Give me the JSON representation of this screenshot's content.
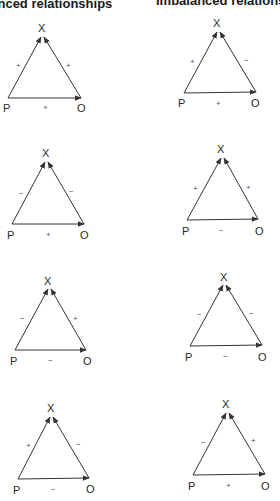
{
  "headers": {
    "left": "Balanced relationships",
    "right": "Imbalanced relationships"
  },
  "colors": {
    "line": "#333333",
    "text": "#1a1a1a"
  },
  "triangles": [
    {
      "group": "balanced",
      "vertex_labels": {
        "top": "X",
        "left": "P",
        "right": "O"
      },
      "signs": {
        "P_X": "+",
        "O_X": "+",
        "P_O": "+"
      }
    },
    {
      "group": "imbalanced",
      "vertex_labels": {
        "top": "X",
        "left": "P",
        "right": "O"
      },
      "signs": {
        "P_X": "+",
        "O_X": "−",
        "P_O": "+"
      }
    },
    {
      "group": "balanced",
      "vertex_labels": {
        "top": "X",
        "left": "P",
        "right": "O"
      },
      "signs": {
        "P_X": "−",
        "O_X": "−",
        "P_O": "+"
      }
    },
    {
      "group": "imbalanced",
      "vertex_labels": {
        "top": "X",
        "left": "P",
        "right": "O"
      },
      "signs": {
        "P_X": "+",
        "O_X": "+",
        "P_O": "−"
      }
    },
    {
      "group": "balanced",
      "vertex_labels": {
        "top": "X",
        "left": "P",
        "right": "O"
      },
      "signs": {
        "P_X": "−",
        "O_X": "+",
        "P_O": "−"
      }
    },
    {
      "group": "imbalanced",
      "vertex_labels": {
        "top": "X",
        "left": "P",
        "right": "O"
      },
      "signs": {
        "P_X": "−",
        "O_X": "−",
        "P_O": "−"
      }
    },
    {
      "group": "balanced",
      "vertex_labels": {
        "top": "X",
        "left": "P",
        "right": "O"
      },
      "signs": {
        "P_X": "+",
        "O_X": "−",
        "P_O": "−"
      }
    },
    {
      "group": "imbalanced",
      "vertex_labels": {
        "top": "X",
        "left": "P",
        "right": "O"
      },
      "signs": {
        "P_X": "−",
        "O_X": "+",
        "P_O": "+"
      }
    }
  ]
}
